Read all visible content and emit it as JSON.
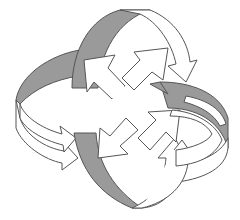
{
  "diagram": {
    "title": "Circular and outward arrows",
    "colors": {
      "background": "#ffffff",
      "line": "#555555",
      "shade": "#9a9a9a",
      "face": "#ffffff"
    },
    "curved_arrows": [
      {
        "id": "top",
        "direction": "clockwise"
      },
      {
        "id": "right",
        "direction": "clockwise"
      },
      {
        "id": "bottom",
        "direction": "clockwise"
      },
      {
        "id": "left",
        "direction": "clockwise"
      }
    ],
    "straight_arrows": [
      {
        "id": "up-left",
        "direction": "northwest"
      },
      {
        "id": "up-right",
        "direction": "northeast"
      },
      {
        "id": "down-right",
        "direction": "southeast"
      },
      {
        "id": "down-left",
        "direction": "southwest"
      }
    ]
  }
}
